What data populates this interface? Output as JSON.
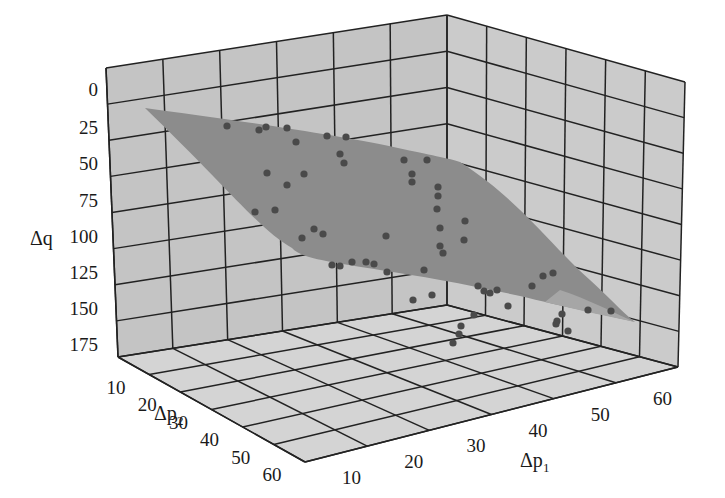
{
  "chart_data": {
    "type": "scatter3d-surface",
    "title": "",
    "xlabel": "Δp1",
    "ylabel": "Δp2",
    "zlabel": "Δq",
    "x_ticks": [
      "10",
      "20",
      "30",
      "40",
      "50",
      "60"
    ],
    "y_ticks": [
      "10",
      "20",
      "30",
      "40",
      "50",
      "60"
    ],
    "z_ticks": [
      "0",
      "25",
      "50",
      "75",
      "100",
      "125",
      "150",
      "175"
    ],
    "xlim": [
      0,
      65
    ],
    "ylim": [
      0,
      65
    ],
    "zlim": [
      0,
      190
    ],
    "z_inverted": true,
    "grid": true,
    "legend": "none",
    "series": [
      {
        "name": "fitted surface",
        "kind": "surface",
        "color": "#8a8a8a",
        "description": "Smooth fitted surface rising from Δq≈10 at low Δp1 / low Δp2 toward Δq≈160 at high Δp1"
      },
      {
        "name": "observations",
        "kind": "scatter",
        "color": "#505050",
        "count": 52
      }
    ],
    "colors": {
      "wall": "#c4c4c4",
      "floor": "#d2d2d2",
      "grid_line": "#222222",
      "surface": "#8c8c8c",
      "surface_light": "#a6a6a6",
      "point": "#4a4a4a"
    }
  },
  "labels": {
    "z_axis": "Δq",
    "x_axis_main": "Δp",
    "x_axis_sub": "1",
    "y_axis_main": "Δp",
    "y_axis_sub": "2"
  }
}
